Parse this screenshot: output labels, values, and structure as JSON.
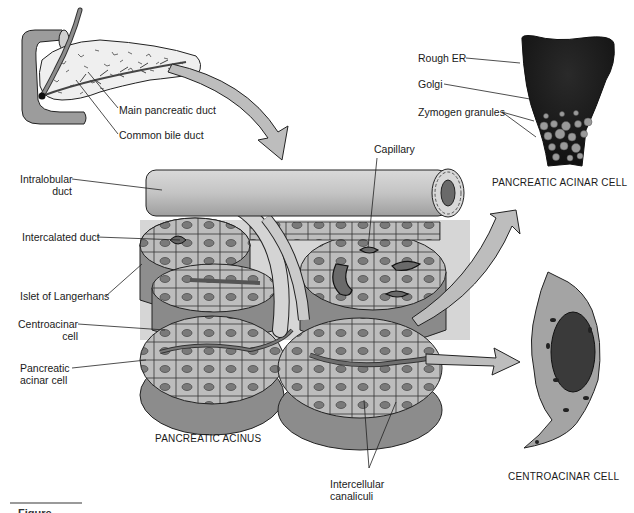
{
  "figure": {
    "caption_fragment": "Figure"
  },
  "panels": {
    "pancreas_overview": {
      "labels": {
        "main_pancreatic_duct": "Main pancreatic duct",
        "common_bile_duct": "Common bile duct"
      }
    },
    "acinar_cell": {
      "title": "PANCREATIC ACINAR CELL",
      "labels": {
        "rough_er": "Rough ER",
        "golgi": "Golgi",
        "zymogen_granules": "Zymogen granules"
      }
    },
    "acinus": {
      "title": "PANCREATIC ACINUS",
      "labels": {
        "capillary": "Capillary",
        "intralobular_duct_line1": "Intralobular",
        "intralobular_duct_line2": "duct",
        "intercalated_duct": "Intercalated duct",
        "islet_of_langerhans": "Islet of Langerhans",
        "centroacinar_cell_line1": "Centroacinar",
        "centroacinar_cell_line2": "cell",
        "pancreatic_acinar_cell_line1": "Pancreatic",
        "pancreatic_acinar_cell_line2": "acinar cell",
        "intercellular_canaliculi_line1": "Intercellular",
        "intercellular_canaliculi_line2": "canaliculi"
      }
    },
    "centroacinar_cell": {
      "title": "CENTROACINAR CELL"
    }
  },
  "colors": {
    "tissue_light": "#c8c8c8",
    "tissue_mid": "#a8a8a8",
    "tissue_dark": "#6e6e6e",
    "cell_dark": "#1c1c1c",
    "outline": "#2a2a2a",
    "arrow_fill": "#b9b9b9"
  }
}
